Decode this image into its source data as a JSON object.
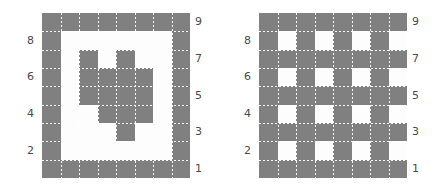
{
  "figure": {
    "background_color": "#ffffff",
    "filled_color": "#808080",
    "empty_color": "#fdfdfd",
    "gridline_color": "#ffffff",
    "tick_label_color": "#4a4a4a"
  },
  "chart_data": [
    {
      "type": "heatmap",
      "name": "left-grid",
      "title": "",
      "xlabel": "",
      "ylabel": "",
      "rows": 9,
      "cols": 8,
      "grid": true,
      "legend": "none",
      "value_labels": {
        "0": "empty",
        "1": "filled"
      },
      "yticks_left": [
        8,
        6,
        4,
        2
      ],
      "yticks_right": [
        9,
        7,
        5,
        3,
        1
      ],
      "ytick_positions_left": [
        8,
        6,
        4,
        2
      ],
      "ytick_positions_right": [
        9,
        7,
        5,
        3,
        1
      ],
      "values": [
        [
          1,
          1,
          1,
          1,
          1,
          1,
          1,
          1
        ],
        [
          1,
          0,
          0,
          0,
          0,
          0,
          0,
          1
        ],
        [
          1,
          0,
          1,
          0,
          1,
          0,
          0,
          1
        ],
        [
          1,
          0,
          1,
          1,
          1,
          1,
          0,
          1
        ],
        [
          1,
          0,
          1,
          1,
          1,
          1,
          0,
          1
        ],
        [
          1,
          0,
          0,
          1,
          1,
          1,
          0,
          1
        ],
        [
          1,
          0,
          0,
          0,
          1,
          0,
          0,
          1
        ],
        [
          1,
          0,
          0,
          0,
          0,
          0,
          0,
          1
        ],
        [
          1,
          1,
          1,
          1,
          1,
          1,
          1,
          1
        ]
      ]
    },
    {
      "type": "heatmap",
      "name": "right-grid",
      "title": "",
      "xlabel": "",
      "ylabel": "",
      "rows": 9,
      "cols": 8,
      "grid": true,
      "legend": "none",
      "value_labels": {
        "0": "empty",
        "1": "filled"
      },
      "yticks_left": [
        8,
        6,
        4,
        2
      ],
      "yticks_right": [
        9,
        7,
        5,
        3,
        1
      ],
      "ytick_positions_left": [
        8,
        6,
        4,
        2
      ],
      "ytick_positions_right": [
        9,
        7,
        5,
        3,
        1
      ],
      "values": [
        [
          1,
          1,
          1,
          1,
          1,
          1,
          1,
          1
        ],
        [
          1,
          0,
          1,
          0,
          1,
          0,
          1,
          0
        ],
        [
          1,
          1,
          1,
          1,
          1,
          1,
          1,
          1
        ],
        [
          1,
          0,
          1,
          0,
          1,
          0,
          1,
          0
        ],
        [
          1,
          1,
          1,
          1,
          1,
          1,
          1,
          1
        ],
        [
          1,
          0,
          1,
          0,
          1,
          0,
          1,
          0
        ],
        [
          1,
          1,
          1,
          1,
          1,
          1,
          1,
          1
        ],
        [
          1,
          0,
          1,
          0,
          1,
          0,
          1,
          0
        ],
        [
          1,
          1,
          1,
          1,
          1,
          1,
          1,
          1
        ]
      ]
    }
  ],
  "panels": [
    {
      "id": "left-panel",
      "ticks_left": [
        "8",
        "6",
        "4",
        "2"
      ],
      "ticks_right": [
        "9",
        "7",
        "5",
        "3",
        "1"
      ]
    },
    {
      "id": "right-panel",
      "ticks_left": [
        "8",
        "6",
        "4",
        "2"
      ],
      "ticks_right": [
        "9",
        "7",
        "5",
        "3",
        "1"
      ]
    }
  ]
}
